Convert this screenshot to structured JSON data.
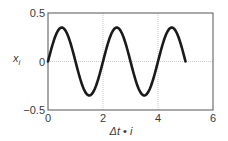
{
  "chart_data": {
    "type": "line",
    "title": "",
    "xlabel": "Δt • i",
    "ylabel": "x_i",
    "xlim": [
      0,
      6
    ],
    "ylim": [
      -0.5,
      0.5
    ],
    "xticks": [
      0,
      2,
      4,
      6
    ],
    "yticks": [
      -0.5,
      0,
      0.5
    ],
    "xtick_labels": [
      "0",
      "2",
      "4",
      "6"
    ],
    "ytick_labels": [
      "−0.5",
      "0",
      "0.5"
    ],
    "grid": true,
    "legend": null,
    "series": [
      {
        "name": "x_i",
        "color": "#1a1a1a",
        "x": [
          0,
          0.25,
          0.5,
          0.75,
          1.0,
          1.25,
          1.5,
          1.75,
          2.0,
          2.25,
          2.5,
          2.75,
          3.0,
          3.25,
          3.5,
          3.75,
          4.0,
          4.25,
          4.5,
          4.75,
          5.0
        ],
        "y": [
          0,
          0.247,
          0.35,
          0.247,
          0,
          -0.247,
          -0.35,
          -0.247,
          0,
          0.247,
          0.35,
          0.247,
          0,
          -0.247,
          -0.35,
          -0.247,
          0,
          0.247,
          0.35,
          0.247,
          0
        ]
      }
    ]
  },
  "axes": {
    "xlabel_main": "Δt",
    "xlabel_dot": " • ",
    "xlabel_var": "i",
    "ylabel_var": "x",
    "ylabel_sub": "i"
  }
}
